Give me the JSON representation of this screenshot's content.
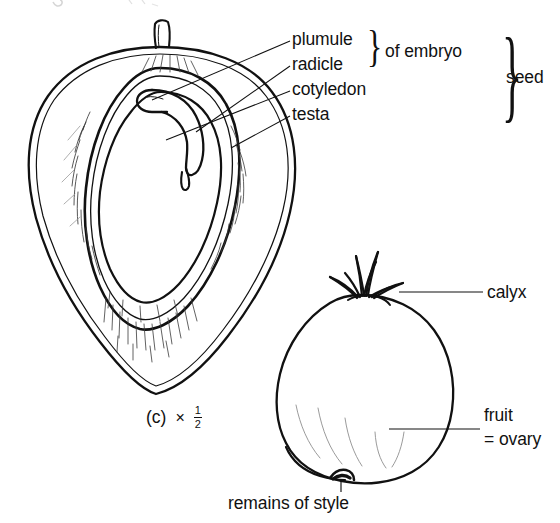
{
  "figure": {
    "caption_id": "(c)",
    "scale_symbol": "×",
    "scale_fraction_numerator": "1",
    "scale_fraction_denominator": "2"
  },
  "labels": {
    "plumule": "plumule",
    "radicle": "radicle",
    "cotyledon": "cotyledon",
    "testa": "testa",
    "of_embryo": "of embryo",
    "seed": "seed",
    "calyx": "calyx",
    "fruit": "fruit",
    "ovary": "= ovary",
    "remains_of_style": "remains of style"
  },
  "braces": {
    "embryo_brace": "}",
    "seed_brace": "}"
  },
  "colors": {
    "ink": "#111111",
    "background": "#ffffff",
    "hatch": "#3a3a3a"
  }
}
